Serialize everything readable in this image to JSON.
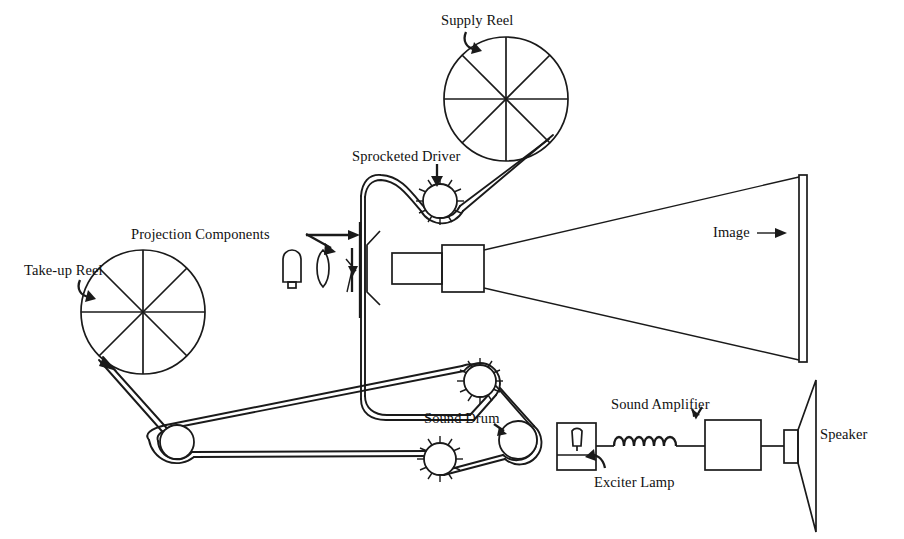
{
  "diagram": {
    "ink_color": "#1a1a1a",
    "background_color": "#ffffff",
    "labels": [
      {
        "id": "supply-reel",
        "text": "Supply Reel",
        "x": 441,
        "y": 12,
        "arrow": "curved-down-right"
      },
      {
        "id": "sprocketed-driver",
        "text": "Sprocketed Driver",
        "x": 352,
        "y": 148,
        "arrow": "straight-down"
      },
      {
        "id": "projection-components",
        "text": "Projection Components",
        "x": 131,
        "y": 226,
        "arrow": "right-and-down-right"
      },
      {
        "id": "take-up-reel",
        "text": "Take-up Reel",
        "x": 24,
        "y": 262,
        "arrow": "curved-down-right"
      },
      {
        "id": "image",
        "text": "Image",
        "x": 713,
        "y": 228,
        "arrow": "right"
      },
      {
        "id": "sound-drum",
        "text": "Sound Drum",
        "x": 424,
        "y": 410,
        "arrow": "short-down-right"
      },
      {
        "id": "sound-amplifier",
        "text": "Sound Amplifier",
        "x": 611,
        "y": 396,
        "arrow": "check-down"
      },
      {
        "id": "exciter-lamp",
        "text": "Exciter Lamp",
        "x": 594,
        "y": 474,
        "arrow": "curved-up-left"
      },
      {
        "id": "speaker",
        "text": "Speaker",
        "x": 820,
        "y": 426,
        "arrow": "none"
      }
    ],
    "components": [
      {
        "id": "supply-reel-wheel",
        "name": "supply-reel",
        "shape": "spoked-wheel",
        "cx": 506,
        "cy": 99,
        "r": 62,
        "spokes": 8
      },
      {
        "id": "take-up-reel-wheel",
        "name": "take-up-reel",
        "shape": "spoked-wheel",
        "cx": 143,
        "cy": 312,
        "r": 62,
        "spokes": 8
      },
      {
        "id": "sprocket-driver",
        "name": "sprocketed-driver",
        "shape": "sprocket",
        "cx": 440,
        "cy": 201,
        "r": 17,
        "teeth": 13
      },
      {
        "id": "sprocket-lower-right",
        "name": "sprocket-roller",
        "shape": "sprocket",
        "cx": 480,
        "cy": 381,
        "r": 16,
        "teeth": 13
      },
      {
        "id": "sprocket-lower-left",
        "name": "sprocket-roller",
        "shape": "sprocket",
        "cx": 440,
        "cy": 459,
        "r": 16,
        "teeth": 13
      },
      {
        "id": "sound-drum-roller",
        "name": "sound-drum",
        "shape": "plain-roller",
        "cx": 518,
        "cy": 440,
        "r": 19
      },
      {
        "id": "idler-roller",
        "name": "idler-roller",
        "shape": "plain-roller",
        "cx": 177,
        "cy": 442,
        "r": 17
      },
      {
        "id": "lamp-bulb",
        "name": "projection-lamp",
        "shape": "bulb",
        "x": 283,
        "y": 250,
        "w": 17,
        "h": 37
      },
      {
        "id": "condenser-lens",
        "name": "condenser-lens",
        "shape": "lens",
        "cx": 323,
        "cy": 268,
        "rx": 7,
        "ry": 18
      },
      {
        "id": "shutter",
        "name": "shutter-blade",
        "shape": "shutter",
        "x": 352,
        "y": 248,
        "h": 44
      },
      {
        "id": "film-gate",
        "name": "film-gate",
        "shape": "vertical-line",
        "x": 360,
        "y1": 222,
        "y2": 318
      },
      {
        "id": "reflector",
        "name": "reflector-bracket",
        "shape": "c-bracket",
        "x": 366,
        "y": 231,
        "h": 74
      },
      {
        "id": "lens-barrel-inner",
        "name": "lens-barrel",
        "shape": "rect",
        "x": 392,
        "y": 253,
        "w": 50,
        "h": 31
      },
      {
        "id": "lens-barrel-outer",
        "name": "lens-housing",
        "shape": "rect",
        "x": 442,
        "y": 245,
        "w": 42,
        "h": 47
      },
      {
        "id": "screen",
        "name": "projection-screen",
        "shape": "rect",
        "x": 799,
        "y": 175,
        "w": 8,
        "h": 187
      },
      {
        "id": "exciter-lamp-box",
        "name": "exciter-lamp-housing",
        "shape": "rect",
        "x": 557,
        "y": 423,
        "w": 39,
        "h": 47
      },
      {
        "id": "amplifier-box",
        "name": "sound-amplifier",
        "shape": "rect",
        "x": 705,
        "y": 420,
        "w": 56,
        "h": 50
      },
      {
        "id": "speaker-magnet",
        "name": "speaker-magnet",
        "shape": "rect",
        "x": 784,
        "y": 430,
        "w": 14,
        "h": 33
      },
      {
        "id": "speaker-cone",
        "name": "speaker-cone",
        "shape": "horn",
        "x": 798,
        "y": 380,
        "w": 18,
        "h": 152
      },
      {
        "id": "coil",
        "name": "amplifier-coil",
        "shape": "coil",
        "x": 614,
        "y": 437,
        "w": 62,
        "loops": 6
      },
      {
        "id": "light-beam",
        "name": "projected-light-beam",
        "shape": "beam"
      },
      {
        "id": "film-path",
        "name": "film-strip-path",
        "shape": "path"
      }
    ]
  }
}
